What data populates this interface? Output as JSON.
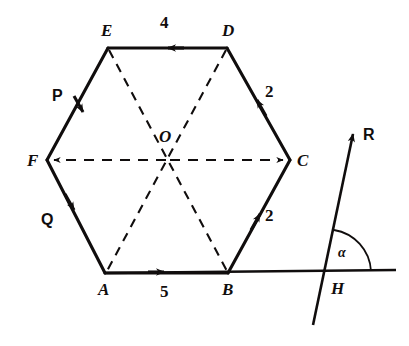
{
  "figure": {
    "stroke_color": "#100d0d",
    "background": "#ffffff",
    "vertices": [
      {
        "name": "A",
        "label": "A",
        "x": 105,
        "y": 273,
        "label_x": 98,
        "label_y": 281
      },
      {
        "name": "B",
        "label": "B",
        "x": 228,
        "y": 273,
        "label_x": 223,
        "label_y": 281
      },
      {
        "name": "C",
        "label": "C",
        "x": 290,
        "y": 160,
        "label_x": 297,
        "label_y": 152
      },
      {
        "name": "D",
        "label": "D",
        "x": 227,
        "y": 48,
        "label_x": 222,
        "label_y": 22
      },
      {
        "name": "E",
        "label": "E",
        "x": 108,
        "y": 48,
        "label_x": 101,
        "label_y": 22
      },
      {
        "name": "F",
        "label": "F",
        "x": 47,
        "y": 160,
        "label_x": 27,
        "label_y": 152
      },
      {
        "name": "O",
        "label": "O",
        "x": 168,
        "y": 160,
        "label_x": 159,
        "label_y": 128
      },
      {
        "name": "H",
        "label": "H",
        "x": 327,
        "y": 273,
        "label_x": 333,
        "label_y": 281
      }
    ],
    "edge_labels": [
      {
        "name": "ed-magnitude",
        "text": "4",
        "x": 162,
        "y": 16
      },
      {
        "name": "dc-magnitude",
        "text": "2",
        "x": 265,
        "y": 83
      },
      {
        "name": "bc-magnitude",
        "text": "2",
        "x": 264,
        "y": 208
      },
      {
        "name": "ab-magnitude",
        "text": "5",
        "x": 161,
        "y": 283
      },
      {
        "name": "ef-vector",
        "text": "P",
        "x": 55,
        "y": 90
      },
      {
        "name": "fa-vector",
        "text": "Q",
        "x": 44,
        "y": 214
      },
      {
        "name": "resultant-vector",
        "text": "R",
        "x": 364,
        "y": 128
      },
      {
        "name": "angle-alpha",
        "text": "α",
        "x": 338,
        "y": 248
      }
    ],
    "solid_edges": [
      {
        "name": "edge-ed",
        "from": "D",
        "to": "E",
        "label": "4",
        "arrow": true
      },
      {
        "name": "edge-dc",
        "from": "C",
        "to": "D",
        "label": "2",
        "arrow": true
      },
      {
        "name": "edge-cb",
        "from": "B",
        "to": "C",
        "label": "2",
        "arrow": true
      },
      {
        "name": "edge-ab",
        "from": "A",
        "to": "B",
        "label": "5",
        "arrow": true
      },
      {
        "name": "edge-ef",
        "from": "E",
        "to": "F",
        "label": "P",
        "arrow": true
      },
      {
        "name": "edge-fa",
        "from": "F",
        "to": "A",
        "label": "Q",
        "arrow": true
      }
    ],
    "dashed_lines": [
      {
        "name": "diagonal-fc",
        "from": "F",
        "to": "C",
        "arrows": "both"
      },
      {
        "name": "diagonal-eb",
        "from": "E",
        "to": "B",
        "arrows": "none"
      },
      {
        "name": "diagonal-da",
        "from": "D",
        "to": "A",
        "arrows": "none"
      }
    ],
    "reference_line": {
      "name": "horizontal-reference-line",
      "x1": 105,
      "y1": 273,
      "x2": 396,
      "y2": 270
    },
    "resultant": {
      "name": "resultant-arrow",
      "x1": 313,
      "y1": 325,
      "x2": 352,
      "y2": 131,
      "tip_label": "R"
    },
    "angle_arc": {
      "name": "alpha-arc",
      "vertex": "H",
      "radius": 38,
      "label": "α"
    }
  }
}
